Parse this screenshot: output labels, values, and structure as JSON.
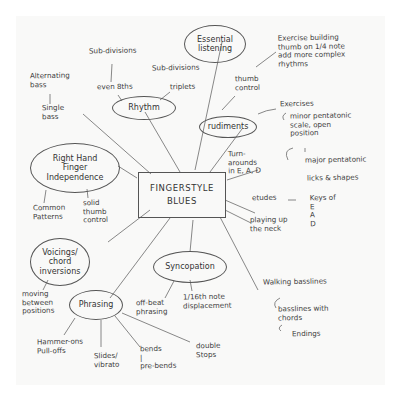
{
  "mindmap": {
    "center": {
      "line1": "FINGERSTYLE",
      "line2": "BLUES"
    },
    "nodes": {
      "essential_listening": "Essential\nlistening",
      "rhythm": "Rhythm",
      "rudiments": "rudiments",
      "right_hand": "Right Hand\nFinger\nIndependence",
      "voicings": "Voicings/\nchord\ninversions",
      "syncopation": "Syncopation",
      "phrasing": "Phrasing"
    },
    "labels": {
      "sub_divisions": "Sub-divisions",
      "sub_divisions_2": "Sub-divisions",
      "even_8ths": "even 8ths",
      "triplets": "triplets",
      "alternating_bass": "Alternating\nbass",
      "single_bass": "Single\nbass",
      "thumb_control": "thumb\ncontrol",
      "thumb_exercise": "Exercise building\nthumb on 1/4 note\nadd more complex\nrhythms",
      "exercises": "Exercises",
      "minor_pentatonic": "minor pentatonic\nscale, open\nposition",
      "major_pentatonic": "major pentatonic",
      "licks_shapes": "licks & shapes",
      "turnarounds": "Turn-\narounds\nin E, A, D",
      "etudes": "etudes",
      "keys_of": "Keys of\nE\nA\nD",
      "playing_up": "playing up\nthe neck",
      "common_patterns": "Common\nPatterns",
      "solid_thumb": "solid\nthumb\ncontrol",
      "moving_between": "moving\nbetween\npositions",
      "walking_basslines": "Walking basslines",
      "basslines_chords": "basslines with\nchords",
      "endings": "Endings",
      "off_beat": "off-beat\nphrasing",
      "sixteenth": "1/16th note\ndisplacement",
      "hammer_pull": "Hammer-ons\nPull-offs",
      "slides_vibrato": "Slides/\nvibrato",
      "bends": "bends\n|\npre-bends",
      "double_stops": "double\nStops"
    },
    "colors": {
      "ink": "#3d3d3d",
      "paper": "#f9f9f8",
      "background": "#ffffff"
    }
  }
}
